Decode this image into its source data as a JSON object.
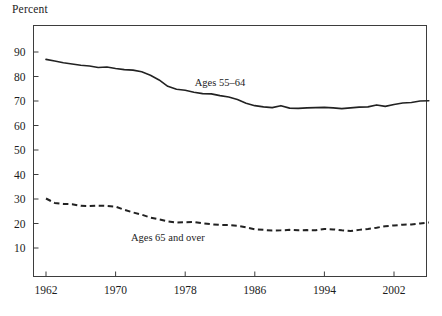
{
  "chart_data": {
    "type": "line",
    "title": "",
    "xlabel": "",
    "ylabel": "Percent",
    "xlim": [
      1962,
      2006
    ],
    "ylim": [
      0,
      100
    ],
    "grid": false,
    "legend_position": "inline-annotation",
    "xticks": [
      1962,
      1970,
      1978,
      1986,
      1994,
      2002
    ],
    "xtick_labels": [
      "1962",
      "1970",
      "1978",
      "1986",
      "1994",
      "2002"
    ],
    "yticks": [
      10,
      20,
      30,
      40,
      50,
      60,
      70,
      80,
      90
    ],
    "ytick_labels": [
      "10",
      "20",
      "30",
      "40",
      "50",
      "60",
      "70",
      "80",
      "90"
    ],
    "x": [
      1962,
      1963,
      1964,
      1965,
      1966,
      1967,
      1968,
      1969,
      1970,
      1971,
      1972,
      1973,
      1974,
      1975,
      1976,
      1977,
      1978,
      1979,
      1980,
      1981,
      1982,
      1983,
      1984,
      1985,
      1986,
      1987,
      1988,
      1989,
      1990,
      1991,
      1992,
      1993,
      1994,
      1995,
      1996,
      1997,
      1998,
      1999,
      2000,
      2001,
      2002,
      2003,
      2004,
      2005,
      2006
    ],
    "series": [
      {
        "name": "Ages 55–64",
        "style": "solid",
        "color": "#222222",
        "label_text": "Ages 55–64",
        "label_x": 1982,
        "label_y": 76,
        "values": [
          87.0,
          86.3,
          85.6,
          85.1,
          84.6,
          84.3,
          83.7,
          83.9,
          83.3,
          82.8,
          82.6,
          81.9,
          80.5,
          78.6,
          76.0,
          74.8,
          74.4,
          73.6,
          73.0,
          72.9,
          72.2,
          71.6,
          70.6,
          69.1,
          68.1,
          67.6,
          67.3,
          68.1,
          67.1,
          67.0,
          67.2,
          67.3,
          67.4,
          67.2,
          66.9,
          67.2,
          67.5,
          67.6,
          68.4,
          67.8,
          68.6,
          69.2,
          69.4,
          70.0,
          70.1
        ]
      },
      {
        "name": "Ages 65 and over",
        "style": "dashed",
        "color": "#222222",
        "label_text": "Ages 65 and over",
        "label_x": 1976,
        "label_y": 12.8,
        "values": [
          30.2,
          28.4,
          28.0,
          27.9,
          27.2,
          27.1,
          27.3,
          27.2,
          26.9,
          25.6,
          24.5,
          23.6,
          22.4,
          21.7,
          20.9,
          20.4,
          20.5,
          20.6,
          20.1,
          19.7,
          19.4,
          19.4,
          19.1,
          18.4,
          17.6,
          17.4,
          17.1,
          17.2,
          17.4,
          17.2,
          17.3,
          17.2,
          17.8,
          17.6,
          17.2,
          16.9,
          17.4,
          17.8,
          18.3,
          18.9,
          19.2,
          19.5,
          19.6,
          20.0,
          20.4
        ]
      }
    ]
  },
  "annotations": {
    "y_axis_title": "Percent"
  }
}
